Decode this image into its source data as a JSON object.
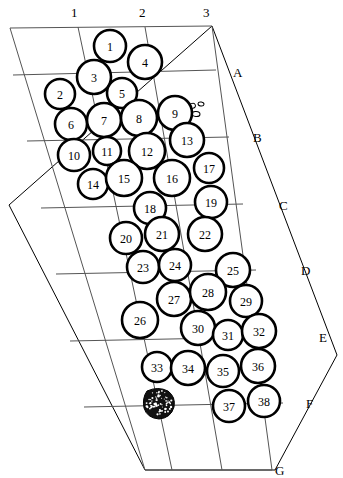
{
  "figure": {
    "kind": "archaeological-site-plan",
    "background_color": "#ffffff",
    "line_color": "#000000",
    "grid_line_color": "#555555",
    "feature_outline_color": "#000000",
    "blob_fill_color": "#111111"
  },
  "column_labels": [
    {
      "text": "1",
      "x": 75,
      "y": 13
    },
    {
      "text": "2",
      "x": 143,
      "y": 13
    },
    {
      "text": "3",
      "x": 207,
      "y": 13
    }
  ],
  "row_labels": [
    {
      "text": "A",
      "x": 237,
      "y": 73
    },
    {
      "text": "B",
      "x": 257,
      "y": 138
    },
    {
      "text": "C",
      "x": 283,
      "y": 206
    },
    {
      "text": "D",
      "x": 305,
      "y": 271
    },
    {
      "text": "E",
      "x": 323,
      "y": 338
    },
    {
      "text": "F",
      "x": 310,
      "y": 404
    },
    {
      "text": "G",
      "x": 279,
      "y": 471
    }
  ],
  "site_boundary": {
    "name": "site-outline-polygon",
    "points": "212,26 337,355 275,470 145,470 9,205"
  },
  "grid": {
    "name": "survey-grid",
    "outline": "10,28 212,26 272,470 145,470",
    "vertical_lines": [
      "78,27 172,470",
      "145,27 222,470"
    ],
    "horizontal_lines": [
      "13,75 216,70",
      "27,141 229,137",
      "41,208 243,204",
      "56,274 256,270",
      "70,341 270,337",
      "84,407 283,403"
    ]
  },
  "features": [
    {
      "id": "1",
      "cx": 110,
      "cy": 46,
      "r": 16
    },
    {
      "id": "2",
      "cx": 60,
      "cy": 94,
      "r": 15
    },
    {
      "id": "3",
      "cx": 94,
      "cy": 77,
      "r": 17
    },
    {
      "id": "4",
      "cx": 145,
      "cy": 62,
      "r": 17
    },
    {
      "id": "5",
      "cx": 122,
      "cy": 93,
      "r": 15
    },
    {
      "id": "6",
      "cx": 71,
      "cy": 124,
      "r": 16
    },
    {
      "id": "7",
      "cx": 104,
      "cy": 120,
      "r": 17
    },
    {
      "id": "8",
      "cx": 139,
      "cy": 118,
      "r": 18
    },
    {
      "id": "9",
      "cx": 175,
      "cy": 113,
      "r": 17
    },
    {
      "id": "10",
      "cx": 74,
      "cy": 155,
      "r": 16
    },
    {
      "id": "11",
      "cx": 107,
      "cy": 151,
      "r": 14
    },
    {
      "id": "12",
      "cx": 147,
      "cy": 151,
      "r": 18
    },
    {
      "id": "13",
      "cx": 187,
      "cy": 140,
      "r": 17
    },
    {
      "id": "14",
      "cx": 93,
      "cy": 184,
      "r": 15
    },
    {
      "id": "15",
      "cx": 124,
      "cy": 178,
      "r": 18
    },
    {
      "id": "16",
      "cx": 172,
      "cy": 178,
      "r": 18
    },
    {
      "id": "17",
      "cx": 209,
      "cy": 168,
      "r": 15
    },
    {
      "id": "18",
      "cx": 150,
      "cy": 208,
      "r": 16
    },
    {
      "id": "19",
      "cx": 211,
      "cy": 202,
      "r": 16
    },
    {
      "id": "20",
      "cx": 126,
      "cy": 238,
      "r": 16
    },
    {
      "id": "21",
      "cx": 162,
      "cy": 234,
      "r": 17
    },
    {
      "id": "22",
      "cx": 205,
      "cy": 234,
      "r": 17
    },
    {
      "id": "23",
      "cx": 143,
      "cy": 267,
      "r": 16
    },
    {
      "id": "24",
      "cx": 175,
      "cy": 265,
      "r": 16
    },
    {
      "id": "25",
      "cx": 233,
      "cy": 270,
      "r": 17
    },
    {
      "id": "26",
      "cx": 140,
      "cy": 320,
      "r": 18
    },
    {
      "id": "27",
      "cx": 174,
      "cy": 299,
      "r": 17
    },
    {
      "id": "28",
      "cx": 208,
      "cy": 292,
      "r": 18
    },
    {
      "id": "29",
      "cx": 246,
      "cy": 301,
      "r": 16
    },
    {
      "id": "30",
      "cx": 198,
      "cy": 328,
      "r": 17
    },
    {
      "id": "31",
      "cx": 228,
      "cy": 335,
      "r": 15
    },
    {
      "id": "32",
      "cx": 259,
      "cy": 331,
      "r": 17
    },
    {
      "id": "33",
      "cx": 157,
      "cy": 367,
      "r": 15
    },
    {
      "id": "34",
      "cx": 188,
      "cy": 368,
      "r": 17
    },
    {
      "id": "35",
      "cx": 223,
      "cy": 371,
      "r": 16
    },
    {
      "id": "36",
      "cx": 258,
      "cy": 366,
      "r": 17
    },
    {
      "id": "37",
      "cx": 229,
      "cy": 406,
      "r": 16
    },
    {
      "id": "38",
      "cx": 264,
      "cy": 401,
      "r": 16
    }
  ],
  "artifacts": [
    {
      "name": "small-artifact-1",
      "cx": 192,
      "cy": 106,
      "rx": 3.5,
      "ry": 2.5,
      "rot": -20
    },
    {
      "name": "small-artifact-2",
      "cx": 201,
      "cy": 104,
      "rx": 3,
      "ry": 2,
      "rot": 10
    },
    {
      "name": "small-artifact-3",
      "cx": 196,
      "cy": 114,
      "rx": 4,
      "ry": 2.5,
      "rot": 5
    }
  ],
  "stippled_blob": {
    "name": "stippled-feature",
    "cx": 159,
    "cy": 403,
    "path": "M147,391 Q158,386 168,391 Q176,397 174,407 Q171,418 159,419 Q147,418 144,408 Q142,398 147,391 Z"
  }
}
